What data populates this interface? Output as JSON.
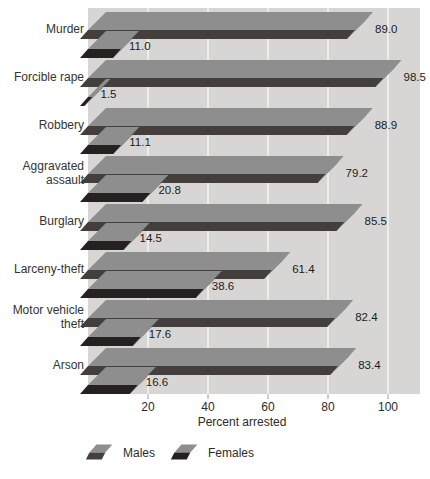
{
  "chart_data": {
    "type": "bar",
    "orientation": "horizontal",
    "style": "3d",
    "categories": [
      "Murder",
      "Forcible rape",
      "Robbery",
      "Aggravated assault",
      "Burglary",
      "Larceny-theft",
      "Motor vehicle theft",
      "Arson"
    ],
    "series": [
      {
        "name": "Males",
        "values": [
          89.0,
          98.5,
          88.9,
          79.2,
          85.5,
          61.4,
          82.4,
          83.4
        ],
        "labels": [
          "89.0",
          "98.5",
          "88.9",
          "79.2",
          "85.5",
          "61.4",
          "82.4",
          "83.4"
        ]
      },
      {
        "name": "Females",
        "values": [
          11.0,
          1.5,
          11.1,
          20.8,
          14.5,
          38.6,
          17.6,
          16.6
        ],
        "labels": [
          "11.0",
          "1.5",
          "11.1",
          "20.8",
          "14.5",
          "38.6",
          "17.6",
          "16.6"
        ]
      }
    ],
    "xlabel": "Percent arrested",
    "xticks": [
      20,
      40,
      60,
      80,
      100
    ],
    "xlim": [
      0,
      110
    ],
    "grid": true,
    "legend_position": "bottom",
    "colors": {
      "plot_bg": "#d7d6d4",
      "gridline": "#f5f4f2",
      "bar_top": "#8e8e8e",
      "males_front": "#443f3c",
      "females_front": "#262020",
      "right_cap": "#6d6d6d",
      "tick": "#a0a0a0",
      "text": "#1c1c1c",
      "axis_text": "#2b2b2b"
    }
  }
}
